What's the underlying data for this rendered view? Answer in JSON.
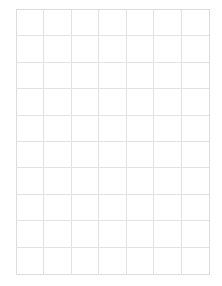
{
  "grid": {
    "columns": 7,
    "rows": 10,
    "line_color": "#e2e2e2",
    "border_color": "#dcdcdc",
    "background": "#ffffff"
  }
}
